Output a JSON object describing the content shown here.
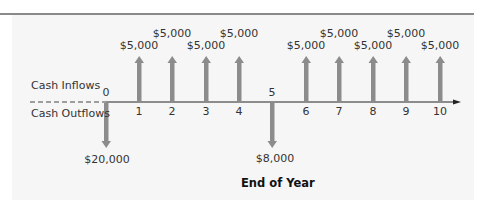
{
  "labels": {
    "inflows": "Cash Inflows",
    "outflows": "Cash Outflows",
    "xaxis_title": "End of Year"
  },
  "colors": {
    "arrow": "#8c8c8c",
    "axis": "#222222",
    "panel": "#f6f6f6",
    "top_rule": "#8a8a8a"
  },
  "ticks": [
    "0",
    "1",
    "2",
    "3",
    "4",
    "5",
    "6",
    "7",
    "8",
    "9",
    "10"
  ],
  "flows": [
    {
      "year": 0,
      "direction": "out",
      "amount": "$20,000"
    },
    {
      "year": 1,
      "direction": "in",
      "amount": "$5,000"
    },
    {
      "year": 2,
      "direction": "in",
      "amount": "$5,000"
    },
    {
      "year": 3,
      "direction": "in",
      "amount": "$5,000"
    },
    {
      "year": 4,
      "direction": "in",
      "amount": "$5,000"
    },
    {
      "year": 5,
      "direction": "out",
      "amount": "$8,000"
    },
    {
      "year": 6,
      "direction": "in",
      "amount": "$5,000"
    },
    {
      "year": 7,
      "direction": "in",
      "amount": "$5,000"
    },
    {
      "year": 8,
      "direction": "in",
      "amount": "$5,000"
    },
    {
      "year": 9,
      "direction": "in",
      "amount": "$5,000"
    },
    {
      "year": 10,
      "direction": "in",
      "amount": "$5,000"
    }
  ]
}
